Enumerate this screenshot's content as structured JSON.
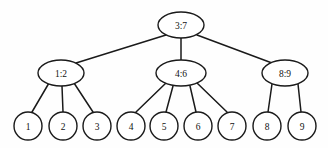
{
  "diagram": {
    "type": "tree",
    "background_color": "#fefefe",
    "stroke_color": "#1a1a1a",
    "node_fill_color": "#ffffff",
    "levels": 3,
    "root": {
      "id": "root",
      "label": "3:7",
      "cx": 181,
      "cy": 25,
      "rx": 23,
      "ry": 13,
      "shape": "ellipse"
    },
    "internal_nodes": [
      {
        "id": "n1",
        "label": "1:2",
        "cx": 61,
        "cy": 73,
        "rx": 23,
        "ry": 13,
        "shape": "ellipse"
      },
      {
        "id": "n2",
        "label": "4:6",
        "cx": 181,
        "cy": 73,
        "rx": 25,
        "ry": 13,
        "shape": "ellipse"
      },
      {
        "id": "n3",
        "label": "8:9",
        "cx": 285,
        "cy": 73,
        "rx": 23,
        "ry": 13,
        "shape": "ellipse"
      }
    ],
    "leaf_nodes": [
      {
        "id": "l1",
        "label": "1",
        "cx": 28,
        "cy": 126,
        "r": 14,
        "shape": "circle",
        "parent": "n1"
      },
      {
        "id": "l2",
        "label": "2",
        "cx": 63,
        "cy": 126,
        "r": 14,
        "shape": "circle",
        "parent": "n1"
      },
      {
        "id": "l3",
        "label": "3",
        "cx": 97,
        "cy": 126,
        "r": 14,
        "shape": "circle",
        "parent": "n1"
      },
      {
        "id": "l4",
        "label": "4",
        "cx": 131,
        "cy": 126,
        "r": 14,
        "shape": "circle",
        "parent": "n2"
      },
      {
        "id": "l5",
        "label": "5",
        "cx": 164,
        "cy": 126,
        "r": 14,
        "shape": "circle",
        "parent": "n2"
      },
      {
        "id": "l6",
        "label": "6",
        "cx": 198,
        "cy": 126,
        "r": 14,
        "shape": "circle",
        "parent": "n2"
      },
      {
        "id": "l7",
        "label": "7",
        "cx": 232,
        "cy": 126,
        "r": 14,
        "shape": "circle",
        "parent": "n2"
      },
      {
        "id": "l8",
        "label": "8",
        "cx": 267,
        "cy": 126,
        "r": 14,
        "shape": "circle",
        "parent": "n3"
      },
      {
        "id": "l9",
        "label": "9",
        "cx": 302,
        "cy": 126,
        "r": 14,
        "shape": "circle",
        "parent": "n3"
      }
    ],
    "edges": [
      {
        "id": "e-root-n1",
        "from": "root",
        "to": "n1",
        "x1": 166,
        "y1": 35,
        "x2": 76,
        "y2": 63
      },
      {
        "id": "e-root-n2",
        "from": "root",
        "to": "n2",
        "x1": 181,
        "y1": 38,
        "x2": 181,
        "y2": 60
      },
      {
        "id": "e-root-n3",
        "from": "root",
        "to": "n3",
        "x1": 197,
        "y1": 35,
        "x2": 272,
        "y2": 63
      },
      {
        "id": "e-n1-l1",
        "from": "n1",
        "to": "l1",
        "x1": 49,
        "y1": 83,
        "x2": 32,
        "y2": 112
      },
      {
        "id": "e-n1-l2",
        "from": "n1",
        "to": "l2",
        "x1": 62,
        "y1": 86,
        "x2": 63,
        "y2": 112
      },
      {
        "id": "e-n1-l3",
        "from": "n1",
        "to": "l3",
        "x1": 74,
        "y1": 83,
        "x2": 93,
        "y2": 112
      },
      {
        "id": "e-n2-l4",
        "from": "n2",
        "to": "l4",
        "x1": 166,
        "y1": 83,
        "x2": 136,
        "y2": 112
      },
      {
        "id": "e-n2-l5",
        "from": "n2",
        "to": "l5",
        "x1": 173,
        "y1": 86,
        "x2": 166,
        "y2": 112
      },
      {
        "id": "e-n2-l6",
        "from": "n2",
        "to": "l6",
        "x1": 190,
        "y1": 86,
        "x2": 196,
        "y2": 112
      },
      {
        "id": "e-n2-l7",
        "from": "n2",
        "to": "l7",
        "x1": 197,
        "y1": 83,
        "x2": 227,
        "y2": 112
      },
      {
        "id": "e-n3-l8",
        "from": "n3",
        "to": "l8",
        "x1": 272,
        "y1": 84,
        "x2": 268,
        "y2": 112
      },
      {
        "id": "e-n3-l9",
        "from": "n3",
        "to": "l9",
        "x1": 298,
        "y1": 84,
        "x2": 301,
        "y2": 112
      }
    ]
  }
}
